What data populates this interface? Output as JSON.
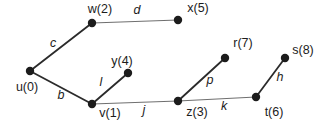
{
  "figure": {
    "background": "#ffffff",
    "text_color": "#1c1c1c",
    "node_style": {
      "radius": 4.2,
      "fill": "#1c1c1c"
    },
    "node_label_font_size": 12.5,
    "edge_label_font_size": 12.5,
    "nodes": [
      {
        "id": "u",
        "label": "u(0)",
        "x": 30,
        "y": 71,
        "label_x": 27,
        "label_y": 87
      },
      {
        "id": "w",
        "label": "w(2)",
        "x": 92,
        "y": 23,
        "label_x": 100,
        "label_y": 9
      },
      {
        "id": "x",
        "label": "x(5)",
        "x": 178,
        "y": 20,
        "label_x": 198,
        "label_y": 8
      },
      {
        "id": "y",
        "label": "y(4)",
        "x": 128,
        "y": 73,
        "label_x": 122,
        "label_y": 61
      },
      {
        "id": "v",
        "label": "v(1)",
        "x": 92,
        "y": 104,
        "label_x": 110,
        "label_y": 113
      },
      {
        "id": "z",
        "label": "z(3)",
        "x": 178,
        "y": 101,
        "label_x": 197,
        "label_y": 112
      },
      {
        "id": "t",
        "label": "t(6)",
        "x": 256,
        "y": 97,
        "label_x": 274,
        "label_y": 112
      },
      {
        "id": "r",
        "label": "r(7)",
        "x": 225,
        "y": 58,
        "label_x": 243,
        "label_y": 43
      },
      {
        "id": "s",
        "label": "s(8)",
        "x": 285,
        "y": 58,
        "label_x": 303,
        "label_y": 50
      }
    ],
    "edges": [
      {
        "label": "c",
        "from": "u",
        "to": "w",
        "label_x": 53,
        "label_y": 43,
        "stroke": "#2b2b2b",
        "width": 1.8
      },
      {
        "label": "d",
        "from": "w",
        "to": "x",
        "label_x": 137,
        "label_y": 10,
        "stroke": "#6f6f6f",
        "width": 1.2
      },
      {
        "label": "b",
        "from": "u",
        "to": "v",
        "label_x": 61,
        "label_y": 95,
        "stroke": "#2b2b2b",
        "width": 1.8
      },
      {
        "label": "l",
        "from": "v",
        "to": "y",
        "label_x": 101,
        "label_y": 82,
        "stroke": "#2b2b2b",
        "width": 1.8
      },
      {
        "label": "j",
        "from": "v",
        "to": "z",
        "label_x": 144,
        "label_y": 110,
        "stroke": "#6f6f6f",
        "width": 1.2
      },
      {
        "label": "p",
        "from": "z",
        "to": "r",
        "label_x": 210,
        "label_y": 80,
        "stroke": "#2b2b2b",
        "width": 1.8
      },
      {
        "label": "k",
        "from": "z",
        "to": "t",
        "label_x": 224,
        "label_y": 106,
        "stroke": "#6f6f6f",
        "width": 1.2
      },
      {
        "label": "h",
        "from": "t",
        "to": "s",
        "label_x": 280,
        "label_y": 77,
        "stroke": "#2b2b2b",
        "width": 1.8
      }
    ]
  }
}
